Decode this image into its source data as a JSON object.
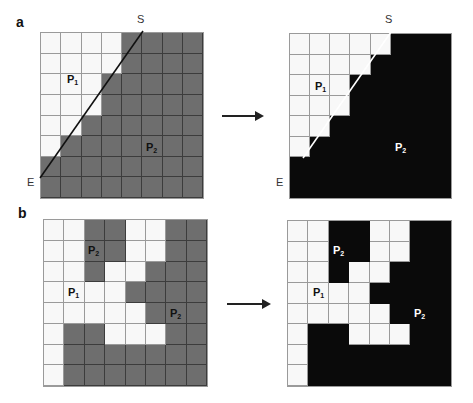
{
  "colors": {
    "white_cell": "#f8f8f8",
    "gray_cell": "#6e6e6e",
    "black_cell": "#0a0a0a",
    "line": "#111111"
  },
  "panel_a": {
    "letter": "a",
    "left": {
      "start_label": "S",
      "end_label": "E",
      "region_labels": [
        {
          "text": "P",
          "sub": "1"
        },
        {
          "text": "P",
          "sub": "2"
        }
      ],
      "cells": [
        "WWWWFFFF",
        "WWWWFFFF",
        "WWWFFFFF",
        "WWWFFFFF",
        "WWFFFFFF",
        "WFFFFFFF",
        "FFFFFFFF",
        "FFFFFFFF"
      ]
    },
    "right": {
      "start_label": "S",
      "end_label": "E",
      "region_labels": [
        {
          "text": "P",
          "sub": "1"
        },
        {
          "text": "P",
          "sub": "2"
        }
      ],
      "cells": [
        "WWWWWFFF",
        "WWWWFFFF",
        "WWWFFFFF",
        "WWWFFFFF",
        "WWFFFFFF",
        "WFFFFFFF",
        "FFFFFFFF",
        "FFFFFFFF"
      ]
    }
  },
  "panel_b": {
    "letter": "b",
    "left": {
      "region_labels": [
        {
          "text": "P",
          "sub": "2"
        },
        {
          "text": "P",
          "sub": "1"
        },
        {
          "text": "P",
          "sub": "2"
        }
      ],
      "cells": [
        "WWFFWWFF",
        "WWFFWWFF",
        "WWFWWFFF",
        "WWWWFFFF",
        "WWWWWFFF",
        "WFFWWWFF",
        "WFFFFFFF",
        "WFFFFFFF"
      ]
    },
    "right": {
      "region_labels": [
        {
          "text": "P",
          "sub": "2"
        },
        {
          "text": "P",
          "sub": "1"
        },
        {
          "text": "P",
          "sub": "2"
        }
      ],
      "cells": [
        "WWFFWWFF",
        "WWFFWWFF",
        "WWFWWFFF",
        "WWWWFFFF",
        "WWWWWFFF",
        "WFFWWWFF",
        "WFFFFFFF",
        "WFFFFFFF"
      ]
    }
  }
}
